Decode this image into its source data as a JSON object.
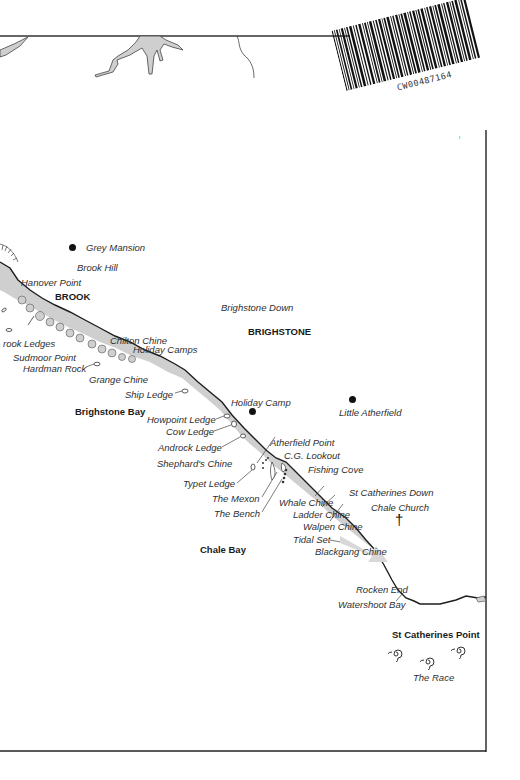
{
  "map": {
    "title": "Isle of Wight south-west coast: Brook to St Catherines Point",
    "barcode": {
      "text": "CW00487164"
    },
    "towns": [
      {
        "name": "BROOK",
        "x": 55,
        "y": 292
      },
      {
        "name": "BRIGHSTONE",
        "x": 248,
        "y": 327
      },
      {
        "name": "Brighstone Bay",
        "x": 75,
        "y": 407
      },
      {
        "name": "Chale Bay",
        "x": 200,
        "y": 545
      },
      {
        "name": "St Catherines Point",
        "x": 392,
        "y": 630
      }
    ],
    "labels": [
      {
        "name": "Grey Mansion",
        "x": 86,
        "y": 244
      },
      {
        "name": "Brook Hill",
        "x": 77,
        "y": 264
      },
      {
        "name": "Hanover Point",
        "x": 21,
        "y": 278
      },
      {
        "name": "Brighstone Down",
        "x": 221,
        "y": 303
      },
      {
        "name": "rook Ledges",
        "x": 3,
        "y": 339
      },
      {
        "name": "Sudmoor Point",
        "x": 13,
        "y": 353
      },
      {
        "name": "Hardman Rock",
        "x": 23,
        "y": 364
      },
      {
        "name": "Chilton Chine",
        "x": 110,
        "y": 337
      },
      {
        "name": "Holiday Camps",
        "x": 133,
        "y": 345
      },
      {
        "name": "Grange Chine",
        "x": 89,
        "y": 375
      },
      {
        "name": "Ship Ledge",
        "x": 125,
        "y": 390
      },
      {
        "name": "Holiday Camp",
        "x": 231,
        "y": 398
      },
      {
        "name": "Little Atherfield",
        "x": 339,
        "y": 408
      },
      {
        "name": "Howpoint Ledge",
        "x": 147,
        "y": 415
      },
      {
        "name": "Cow Ledge",
        "x": 166,
        "y": 427
      },
      {
        "name": "Androck Ledge",
        "x": 158,
        "y": 443
      },
      {
        "name": "Atherfield Point",
        "x": 270,
        "y": 438
      },
      {
        "name": "C.G. Lookout",
        "x": 284,
        "y": 451
      },
      {
        "name": "Shephard's Chine",
        "x": 157,
        "y": 459
      },
      {
        "name": "Fishing Cove",
        "x": 308,
        "y": 465
      },
      {
        "name": "Typet Ledge",
        "x": 183,
        "y": 479
      },
      {
        "name": "St Catherines Down",
        "x": 349,
        "y": 488
      },
      {
        "name": "The Mexon",
        "x": 212,
        "y": 494
      },
      {
        "name": "Whale Chine",
        "x": 279,
        "y": 498
      },
      {
        "name": "Chale Church",
        "x": 371,
        "y": 503
      },
      {
        "name": "The Bench",
        "x": 214,
        "y": 509
      },
      {
        "name": "Ladder Chine",
        "x": 293,
        "y": 510
      },
      {
        "name": "Walpen Chine",
        "x": 303,
        "y": 522
      },
      {
        "name": "Tidal Set",
        "x": 293,
        "y": 535
      },
      {
        "name": "Blackgang Chine",
        "x": 315,
        "y": 547
      },
      {
        "name": "Rocken End",
        "x": 356,
        "y": 585
      },
      {
        "name": "Watershoot Bay",
        "x": 338,
        "y": 600
      },
      {
        "name": "The Race",
        "x": 413,
        "y": 673
      }
    ],
    "symbols": {
      "settlement_dots": [
        "Grey Mansion",
        "Holiday Camp",
        "Little Atherfield"
      ],
      "church_cross": "Chale Church",
      "race_swirls": 3
    },
    "colors": {
      "land_shading": "#cfcfcf",
      "coast_line": "#1e1e1e",
      "frame": "#222222",
      "background": "#ffffff"
    }
  }
}
